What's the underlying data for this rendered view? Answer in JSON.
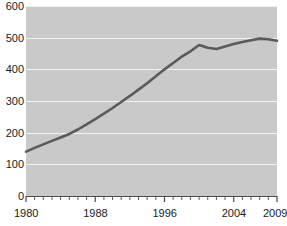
{
  "chart_data": {
    "type": "line",
    "title": "",
    "subtitle": "",
    "xlabel": "",
    "ylabel": "",
    "xlim": [
      1980,
      2009
    ],
    "ylim": [
      0,
      600
    ],
    "grid": true,
    "legend": null,
    "y_ticks": [
      0,
      100,
      200,
      300,
      400,
      500,
      600
    ],
    "y_tick_labels": [
      "0",
      "100",
      "200",
      "300",
      "400",
      "500",
      "600"
    ],
    "x_tick_labels": [
      "1980",
      "1988",
      "1996",
      "2004",
      "2009"
    ],
    "x_tick_label_years": [
      1980,
      1988,
      1996,
      2004,
      2009
    ],
    "x_minor_tick_interval": 1,
    "line_color": "#5a5a5a",
    "line_width": 2.6,
    "plot_background": "#c9c9c9",
    "gridline_color": "#f2f2f2",
    "axis_color": "#4a4a4a",
    "text_color": "#1a1a1a",
    "x": [
      1980,
      1981,
      1982,
      1983,
      1984,
      1985,
      1986,
      1987,
      1988,
      1989,
      1990,
      1991,
      1992,
      1993,
      1994,
      1995,
      1996,
      1997,
      1998,
      1999,
      2000,
      2001,
      2002,
      2003,
      2004,
      2005,
      2006,
      2007,
      2008,
      2009
    ],
    "values": [
      140,
      152,
      163,
      174,
      185,
      196,
      210,
      226,
      243,
      260,
      278,
      297,
      316,
      336,
      356,
      378,
      400,
      420,
      440,
      457,
      477,
      468,
      464,
      472,
      480,
      486,
      492,
      497,
      495,
      490
    ],
    "series": [
      {
        "name": "series-1",
        "values": [
          140,
          152,
          163,
          174,
          185,
          196,
          210,
          226,
          243,
          260,
          278,
          297,
          316,
          336,
          356,
          378,
          400,
          420,
          440,
          457,
          477,
          468,
          464,
          472,
          480,
          486,
          492,
          497,
          495,
          490
        ]
      }
    ]
  }
}
